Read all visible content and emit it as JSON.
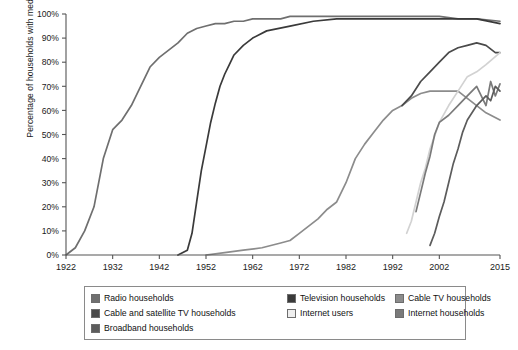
{
  "chart_data": {
    "type": "line",
    "title": "",
    "xlabel": "",
    "ylabel": "Percentage of households with media",
    "xlim": [
      1922,
      2015
    ],
    "ylim": [
      0,
      100
    ],
    "grid": false,
    "legend_position": "bottom",
    "xticks": [
      "1922",
      "1932",
      "1942",
      "1952",
      "1962",
      "1972",
      "1982",
      "1992",
      "2002",
      "2015"
    ],
    "xtick_values": [
      1922,
      1932,
      1942,
      1952,
      1962,
      1972,
      1982,
      1992,
      2002,
      2015
    ],
    "yticks": [
      "0%",
      "10%",
      "20%",
      "30%",
      "40%",
      "50%",
      "60%",
      "70%",
      "80%",
      "90%",
      "100%"
    ],
    "ytick_values": [
      0,
      10,
      20,
      30,
      40,
      50,
      60,
      70,
      80,
      90,
      100
    ],
    "series": [
      {
        "name": "Radio households",
        "color": "#6f6f6f",
        "x": [
          1922,
          1924,
          1926,
          1928,
          1930,
          1932,
          1934,
          1936,
          1938,
          1940,
          1942,
          1944,
          1946,
          1948,
          1950,
          1952,
          1954,
          1956,
          1958,
          1960,
          1962,
          1964,
          1966,
          1968,
          1970,
          1974,
          1978,
          1982,
          1986,
          1990,
          1994,
          1998,
          2002,
          2006,
          2010,
          2015
        ],
        "y": [
          0,
          3,
          10,
          20,
          40,
          52,
          56,
          62,
          70,
          78,
          82,
          85,
          88,
          92,
          94,
          95,
          96,
          96,
          97,
          97,
          98,
          98,
          98,
          98,
          99,
          99,
          99,
          99,
          99,
          99,
          99,
          99,
          99,
          98,
          98,
          97
        ]
      },
      {
        "name": "Television households",
        "color": "#3a3a3a",
        "x": [
          1946,
          1948,
          1949,
          1950,
          1951,
          1952,
          1953,
          1954,
          1955,
          1956,
          1957,
          1958,
          1960,
          1962,
          1965,
          1970,
          1975,
          1980,
          1985,
          1990,
          1995,
          2000,
          2005,
          2010,
          2015
        ],
        "y": [
          0,
          2,
          9,
          22,
          35,
          45,
          55,
          63,
          70,
          75,
          79,
          83,
          87,
          90,
          93,
          95,
          97,
          98,
          98,
          98,
          98,
          98,
          98,
          98,
          96
        ]
      },
      {
        "name": "Cable TV households",
        "color": "#8c8c8c",
        "x": [
          1952,
          1956,
          1960,
          1964,
          1968,
          1970,
          1972,
          1974,
          1976,
          1978,
          1980,
          1982,
          1984,
          1986,
          1988,
          1990,
          1992,
          1994,
          1996,
          1998,
          2000,
          2002,
          2004,
          2006,
          2008,
          2010,
          2012,
          2015
        ],
        "y": [
          0,
          1,
          2,
          3,
          5,
          6,
          9,
          12,
          15,
          19,
          22,
          30,
          40,
          46,
          51,
          56,
          60,
          62,
          65,
          67,
          68,
          68,
          68,
          68,
          65,
          62,
          59,
          56
        ]
      },
      {
        "name": "Cable and satellite TV households",
        "color": "#4a4a4a",
        "x": [
          1994,
          1996,
          1998,
          2000,
          2002,
          2004,
          2006,
          2008,
          2010,
          2012,
          2014,
          2015
        ],
        "y": [
          62,
          66,
          72,
          76,
          80,
          84,
          86,
          87,
          88,
          87,
          84,
          84
        ]
      },
      {
        "name": "Internet users",
        "color": "#d2d2d2",
        "x": [
          1995,
          1996,
          1997,
          1998,
          1999,
          2000,
          2002,
          2004,
          2006,
          2008,
          2010,
          2012,
          2015
        ],
        "y": [
          9,
          14,
          22,
          30,
          36,
          44,
          55,
          62,
          68,
          74,
          76,
          79,
          84
        ]
      },
      {
        "name": "Internet households",
        "color": "#7a7a7a",
        "x": [
          1997,
          1998,
          1999,
          2000,
          2001,
          2002,
          2004,
          2006,
          2008,
          2010,
          2012,
          2013,
          2014,
          2015
        ],
        "y": [
          18,
          26,
          34,
          41,
          50,
          55,
          58,
          62,
          66,
          70,
          62,
          72,
          66,
          71
        ]
      },
      {
        "name": "Broadband households",
        "color": "#5c5c5c",
        "x": [
          2000,
          2001,
          2002,
          2003,
          2004,
          2005,
          2006,
          2007,
          2008,
          2010,
          2012,
          2013,
          2014,
          2015
        ],
        "y": [
          4,
          9,
          16,
          22,
          30,
          38,
          44,
          51,
          56,
          62,
          66,
          64,
          70,
          68
        ]
      }
    ]
  },
  "legend": {
    "items": [
      {
        "label": "Radio households",
        "color": "#6f6f6f"
      },
      {
        "label": "Television households",
        "color": "#3a3a3a"
      },
      {
        "label": "Cable TV households",
        "color": "#8c8c8c"
      },
      {
        "label": "Cable and satellite TV households",
        "color": "#4a4a4a"
      },
      {
        "label": "Internet users",
        "color": "#eeeeee"
      },
      {
        "label": "Internet households",
        "color": "#7a7a7a"
      },
      {
        "label": "Broadband households",
        "color": "#5c5c5c"
      }
    ]
  }
}
